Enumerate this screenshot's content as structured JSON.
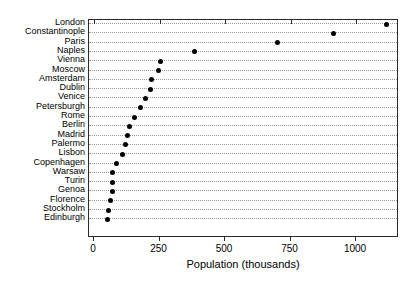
{
  "chart_data": {
    "type": "scatter",
    "subtype": "dot-plot",
    "title": "",
    "xlabel": "Population (thousands)",
    "ylabel": "",
    "xlim": [
      0,
      1165
    ],
    "ylim": null,
    "grid": "horizontal-dotted",
    "legend": null,
    "orientation": "horizontal",
    "sorted": "descending",
    "xticks": [
      0,
      250,
      500,
      750,
      1000
    ],
    "xticklabels": [
      "0",
      "250",
      "500",
      "750",
      "1000"
    ],
    "categories": [
      "London",
      "Constantinople",
      "Paris",
      "Naples",
      "Vienna",
      "Moscow",
      "Amsterdam",
      "Dublin",
      "Venice",
      "Petersburgh",
      "Rome",
      "Berlin",
      "Madrid",
      "Palermo",
      "Lisbon",
      "Copenhagen",
      "Warsaw",
      "Turin",
      "Genoa",
      "Florence",
      "Stockholm",
      "Edinburgh"
    ],
    "values": [
      1115,
      915,
      700,
      382,
      255,
      248,
      221,
      214,
      198,
      179,
      153,
      134,
      126,
      122,
      107,
      84,
      72,
      69,
      69,
      63,
      54,
      50
    ],
    "marker": {
      "shape": "circle",
      "filled": true,
      "color": "#000000",
      "size": 5
    },
    "colors": {
      "axis": "#2b2b2b",
      "grid": "#9a9a9a",
      "marker": "#000000",
      "text": "#000000",
      "background": "#ffffff"
    }
  },
  "geometry": {
    "plot_left": 88,
    "plot_top": 19,
    "plot_width": 310,
    "plot_height": 218,
    "x_zero_px": 93,
    "px_per_unit": 0.262,
    "row_first_y": 23,
    "row_spacing": 9.3
  }
}
